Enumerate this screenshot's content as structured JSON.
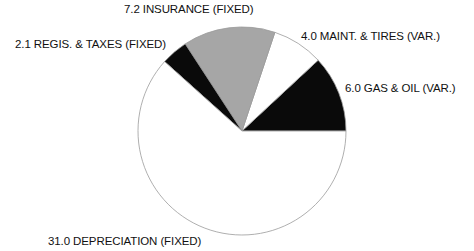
{
  "chart_data": {
    "type": "pie",
    "title": "",
    "start_angle_deg": 0,
    "direction": "counterclockwise",
    "total": 50.3,
    "slices": [
      {
        "label": "GAS & OIL (VAR.)",
        "value": 6.0,
        "display": "6.0 GAS & OIL (VAR.)",
        "color": "#0a0a0a"
      },
      {
        "label": "MAINT. & TIRES (VAR.)",
        "value": 4.0,
        "display": "4.0 MAINT. & TIRES (VAR.)",
        "color": "#ffffff"
      },
      {
        "label": "INSURANCE (FIXED)",
        "value": 7.2,
        "display": "7.2 INSURANCE (FIXED)",
        "color": "#a6a6a6"
      },
      {
        "label": "REGIS. & TAXES (FIXED)",
        "value": 2.1,
        "display": "2.1 REGIS. & TAXES (FIXED)",
        "color": "#0a0a0a"
      },
      {
        "label": "DEPRECIATION (FIXED)",
        "value": 31.0,
        "display": "31.0 DEPRECIATION (FIXED)",
        "color": "#ffffff"
      }
    ]
  },
  "labels": {
    "gas": "6.0 GAS & OIL (VAR.)",
    "maint": "4.0 MAINT. & TIRES (VAR.)",
    "insurance": "7.2 INSURANCE (FIXED)",
    "regis": "2.1 REGIS. & TAXES (FIXED)",
    "depreciation": "31.0 DEPRECIATION (FIXED)"
  }
}
